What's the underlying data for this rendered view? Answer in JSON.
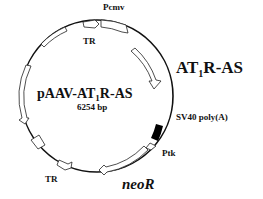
{
  "plasmid": {
    "name_prefix": "pAAV-AT",
    "name_sub": "1",
    "name_suffix": "R-AS",
    "size": "6254 bp"
  },
  "features": {
    "pcmv": "Pcmv",
    "tr_top": "TR",
    "insert_prefix": "AT",
    "insert_sub": "1",
    "insert_suffix": "R-AS",
    "sv40": "SV40 poly(A)",
    "ptk": "Ptk",
    "neor": "neoR",
    "tr_bottom": "TR"
  },
  "colors": {
    "line": "#111111",
    "fill": "#ffffff",
    "polyA": "#000000"
  }
}
